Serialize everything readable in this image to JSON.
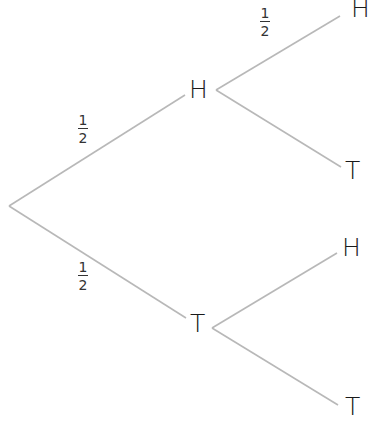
{
  "diagram": {
    "type": "probability-tree",
    "root": {
      "x": 9,
      "y": 206
    },
    "level1": [
      {
        "label": "H",
        "probability": {
          "num": "1",
          "den": "2"
        }
      },
      {
        "label": "T",
        "probability": {
          "num": "1",
          "den": "2"
        }
      }
    ],
    "level2": [
      {
        "parent": "H",
        "label": "H",
        "probability": {
          "num": "1",
          "den": "2"
        }
      },
      {
        "parent": "H",
        "label": "T"
      },
      {
        "parent": "T",
        "label": "H"
      },
      {
        "parent": "T",
        "label": "T"
      }
    ],
    "colors": {
      "edge": "#b8b8b8",
      "text": "#1a1a1a",
      "background": "#ffffff"
    }
  }
}
